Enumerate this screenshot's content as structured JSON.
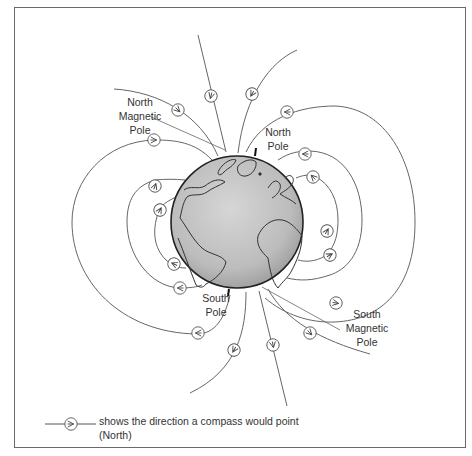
{
  "labels": {
    "north_magnetic_pole": [
      "North",
      "Magnetic",
      "Pole"
    ],
    "north_pole": [
      "North",
      "Pole"
    ],
    "south_pole": [
      "South",
      "Pole"
    ],
    "south_magnetic_pole": [
      "South",
      "Magnetic",
      "Pole"
    ]
  },
  "legend": {
    "line1": "shows the direction a compass would point",
    "line2": "(North)",
    "symbol": "compass-arrow-icon"
  },
  "colors": {
    "line": "#555555",
    "globe_fill": "#b9b9b9",
    "globe_outline": "#222222",
    "frame": "#6a6a6a",
    "text": "#333333"
  },
  "diagram": {
    "globe_center": [
      237,
      222
    ],
    "globe_radius": 66
  }
}
